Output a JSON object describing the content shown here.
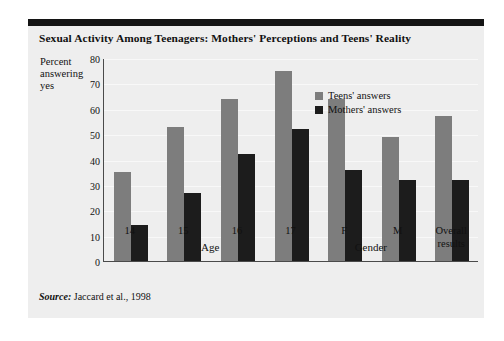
{
  "figure": {
    "title": "Sexual Activity Among Teenagers: Mothers' Perceptions and Teens' Reality",
    "source_word": "Source:",
    "source_text": " Jaccard et al., 1998"
  },
  "legend": {
    "position": "inside-top-right",
    "items": [
      {
        "label": "Teens' answers",
        "color": "#7d7d7d"
      },
      {
        "label": "Mothers' answers",
        "color": "#1c1c1c"
      }
    ]
  },
  "axis": {
    "y_label_line1": "Percent",
    "y_label_line2": "answering",
    "y_label_line3": "yes",
    "y_ticks": [
      "0",
      "10",
      "20",
      "30",
      "40",
      "50",
      "60",
      "70",
      "80"
    ],
    "group_label_age": "Age",
    "group_label_gender": "Gender"
  },
  "chart_data": {
    "type": "bar",
    "title": "Sexual Activity Among Teenagers: Mothers' Perceptions and Teens' Reality",
    "xlabel": "",
    "ylabel": "Percent answering yes",
    "ylim": [
      0,
      80
    ],
    "ytick_step": 10,
    "grid": true,
    "legend_position": "inside-top-right",
    "categories": [
      "14",
      "15",
      "16",
      "17",
      "F",
      "M",
      "Overall results"
    ],
    "category_groups": [
      "Age",
      "Age",
      "Age",
      "Age",
      "Gender",
      "Gender",
      ""
    ],
    "series": [
      {
        "name": "Teens' answers",
        "color": "#7d7d7d",
        "values": [
          35,
          53,
          64,
          75,
          64,
          49,
          57
        ]
      },
      {
        "name": "Mothers' answers",
        "color": "#1c1c1c",
        "values": [
          14,
          27,
          42,
          52,
          36,
          32,
          32
        ]
      }
    ]
  }
}
